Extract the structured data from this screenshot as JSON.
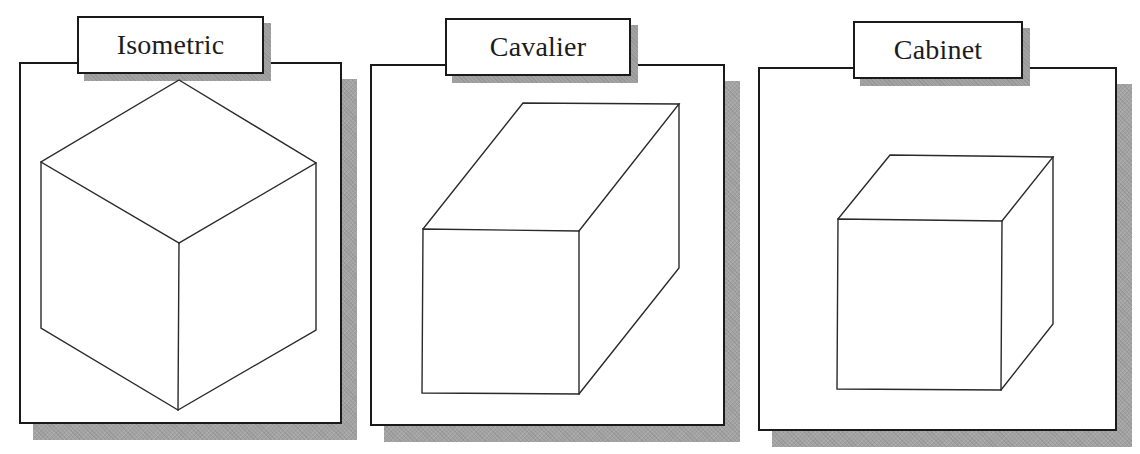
{
  "figure": {
    "panels": [
      {
        "id": "isometric",
        "label": "Isometric",
        "projection": "isometric",
        "panel_box": {
          "x": 19,
          "y": 62,
          "w": 323,
          "h": 362
        },
        "panel_shadow": {
          "x": 33,
          "y": 79,
          "w": 324,
          "h": 361
        },
        "label_box": {
          "x": 77,
          "y": 16,
          "w": 187,
          "h": 58
        },
        "label_shadow": {
          "x": 84,
          "y": 23,
          "w": 187,
          "h": 58
        }
      },
      {
        "id": "cavalier",
        "label": "Cavalier",
        "projection": "cavalier",
        "panel_box": {
          "x": 370,
          "y": 64,
          "w": 355,
          "h": 362
        },
        "panel_shadow": {
          "x": 384,
          "y": 81,
          "w": 356,
          "h": 361
        },
        "label_box": {
          "x": 445,
          "y": 18,
          "w": 186,
          "h": 58
        },
        "label_shadow": {
          "x": 452,
          "y": 25,
          "w": 186,
          "h": 58
        }
      },
      {
        "id": "cabinet",
        "label": "Cabinet",
        "projection": "cabinet",
        "panel_box": {
          "x": 758,
          "y": 67,
          "w": 359,
          "h": 364
        },
        "panel_shadow": {
          "x": 772,
          "y": 84,
          "w": 360,
          "h": 363
        },
        "label_box": {
          "x": 853,
          "y": 21,
          "w": 170,
          "h": 58
        },
        "label_shadow": {
          "x": 860,
          "y": 28,
          "w": 170,
          "h": 58
        }
      }
    ],
    "colors": {
      "line": "#2a2a2a",
      "border": "#1a1a1a",
      "shadow": "#a3a3a3",
      "background": "#ffffff",
      "text": "#1c1c1c"
    }
  }
}
